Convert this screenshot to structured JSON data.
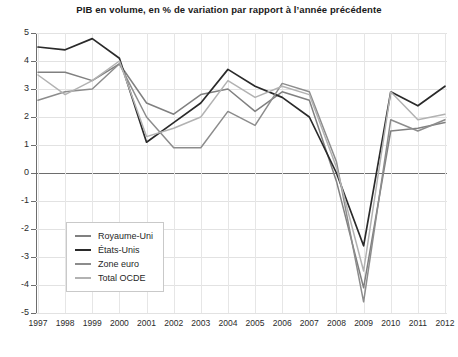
{
  "chart": {
    "title": "PIB en volume, en % de variation par rapport à l’année précédente"
  },
  "legend": {
    "position": "inside-bottom-left",
    "items": [
      {
        "label": "Royaume-Uni",
        "color": "#808080"
      },
      {
        "label": "États-Unis",
        "color": "#2a2a2a"
      },
      {
        "label": "Zone euro",
        "color": "#8c8c8c"
      },
      {
        "label": "Total OCDE",
        "color": "#b2b2b2"
      }
    ]
  },
  "axes": {
    "y_ticks": [
      "5",
      "4",
      "3",
      "2",
      "1",
      "0",
      "-1",
      "-2",
      "-3",
      "-4",
      "-5"
    ],
    "x_ticks": [
      "1997",
      "1998",
      "1999",
      "2000",
      "2001",
      "2002",
      "2003",
      "2004",
      "2005",
      "2006",
      "2007",
      "2008",
      "2009",
      "2010",
      "2011",
      "2012"
    ]
  },
  "chart_data": {
    "type": "line",
    "title": "PIB en volume, en % de variation par rapport à l’année précédente",
    "xlabel": "",
    "ylabel": "",
    "ylim": [
      -5,
      5
    ],
    "grid": true,
    "legend_position": "inside-bottom-left",
    "categories": [
      "1997",
      "1998",
      "1999",
      "2000",
      "2001",
      "2002",
      "2003",
      "2004",
      "2005",
      "2006",
      "2007",
      "2008",
      "2009",
      "2010",
      "2011",
      "2012"
    ],
    "series": [
      {
        "name": "Royaume-Uni",
        "color": "#808080",
        "values": [
          3.6,
          3.6,
          3.3,
          3.9,
          2.5,
          2.1,
          2.8,
          3.0,
          2.2,
          2.9,
          2.6,
          -0.3,
          -4.1,
          1.5,
          1.6,
          1.8
        ]
      },
      {
        "name": "États-Unis",
        "color": "#2a2a2a",
        "values": [
          4.5,
          4.4,
          4.8,
          4.1,
          1.1,
          1.8,
          2.5,
          3.7,
          3.1,
          2.7,
          2.0,
          0.0,
          -2.6,
          2.9,
          2.4,
          3.1
        ]
      },
      {
        "name": "Zone euro",
        "color": "#8c8c8c",
        "values": [
          2.6,
          2.9,
          3.0,
          3.9,
          2.0,
          0.9,
          0.9,
          2.2,
          1.7,
          3.2,
          2.9,
          0.4,
          -4.6,
          1.9,
          1.5,
          1.9
        ]
      },
      {
        "name": "Total OCDE",
        "color": "#b2b2b2",
        "values": [
          3.5,
          2.8,
          3.3,
          4.0,
          1.3,
          1.6,
          2.0,
          3.3,
          2.7,
          3.1,
          2.8,
          0.2,
          -3.5,
          2.9,
          1.9,
          2.1
        ]
      }
    ]
  }
}
